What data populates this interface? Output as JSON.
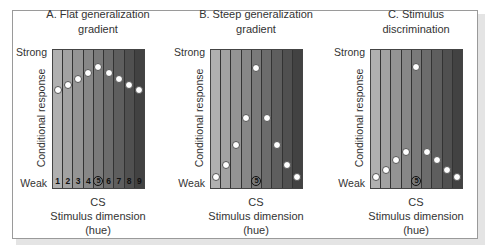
{
  "chart_data": [
    {
      "type": "scatter",
      "title": "A. Flat generalization gradient",
      "xlabel": "CS Stimulus dimension (hue)",
      "ylabel": "Conditional response",
      "y_tick_labels": {
        "top": "Strong",
        "bottom": "Weak"
      },
      "categories": [
        "1",
        "2",
        "3",
        "4",
        "5",
        "6",
        "7",
        "8",
        "9"
      ],
      "cs_category": "5",
      "category_numbers_shown": true,
      "values": [
        7.1,
        7.5,
        7.9,
        8.3,
        8.8,
        8.3,
        7.9,
        7.5,
        7.1
      ],
      "ylim": [
        0,
        10
      ],
      "grid": false
    },
    {
      "type": "scatter",
      "title": "B. Steep generalization gradient",
      "xlabel": "CS Stimulus dimension (hue)",
      "ylabel": "Conditional response",
      "y_tick_labels": {
        "top": "Strong",
        "bottom": "Weak"
      },
      "categories": [
        "1",
        "2",
        "3",
        "4",
        "5",
        "6",
        "7",
        "8",
        "9"
      ],
      "cs_category": "5",
      "category_numbers_shown": false,
      "values": [
        0.8,
        1.7,
        3.1,
        5.1,
        8.7,
        5.1,
        3.1,
        1.7,
        0.8
      ],
      "ylim": [
        0,
        10
      ],
      "grid": false
    },
    {
      "type": "scatter",
      "title": "C. Stimulus discrimination",
      "xlabel": "CS Stimulus dimension (hue)",
      "ylabel": "Conditional response",
      "y_tick_labels": {
        "top": "Strong",
        "bottom": "Weak"
      },
      "categories": [
        "1",
        "2",
        "3",
        "4",
        "5",
        "6",
        "7",
        "8",
        "9"
      ],
      "cs_category": "5",
      "category_numbers_shown": false,
      "values": [
        0.8,
        1.3,
        2.0,
        2.6,
        8.8,
        2.6,
        2.0,
        1.3,
        0.8
      ],
      "ylim": [
        0,
        10
      ],
      "grid": false
    }
  ],
  "panels": [
    {
      "title_line1": "A. Flat generalization",
      "title_line2": "gradient"
    },
    {
      "title_line1": "B. Steep generalization",
      "title_line2": "gradient"
    },
    {
      "title_line1": "C. Stimulus",
      "title_line2": "discrimination"
    }
  ],
  "labels": {
    "strong": "Strong",
    "weak": "Weak",
    "ylabel": "Conditional response",
    "x_cs": "CS",
    "x_dim": "Stimulus dimension",
    "x_hue": "(hue)"
  },
  "stripe_colors": [
    "#b0b0b0",
    "#a2a2a2",
    "#949494",
    "#878787",
    "#7a7a7a",
    "#6c6c6c",
    "#5e5e5e",
    "#505050",
    "#424242"
  ]
}
